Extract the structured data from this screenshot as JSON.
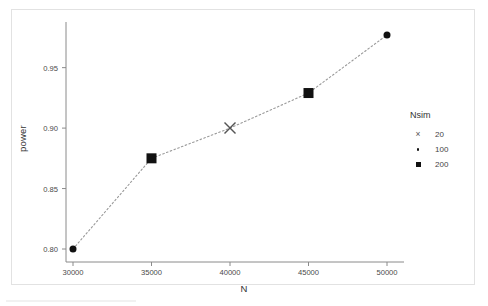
{
  "chart_data": {
    "type": "scatter",
    "title": "",
    "xlabel": "N",
    "ylabel": "power",
    "xlim": [
      28500,
      51500
    ],
    "ylim": [
      0.785,
      0.988
    ],
    "grid": false,
    "connector": "dotted-line",
    "x": [
      30000,
      35000,
      40000,
      45000,
      50000
    ],
    "values": [
      0.8,
      0.875,
      0.9,
      0.929,
      0.977
    ],
    "point_markers": [
      "circle",
      "square",
      "cross",
      "square",
      "circle"
    ],
    "point_groups": [
      100,
      200,
      20,
      200,
      100
    ],
    "xticks": [
      30000,
      35000,
      40000,
      45000,
      50000
    ],
    "xticklabels": [
      "30000",
      "35000",
      "40000",
      "45000",
      "50000"
    ],
    "yticks": [
      0.8,
      0.85,
      0.9,
      0.95
    ],
    "yticklabels": [
      "0.80",
      "0.85",
      "0.90",
      "0.95"
    ],
    "legend": {
      "title": "Nsim",
      "position": "right",
      "entries": [
        {
          "label": "20",
          "marker": "cross"
        },
        {
          "label": "100",
          "marker": "dot"
        },
        {
          "label": "200",
          "marker": "square"
        }
      ]
    },
    "colors": {
      "marker": "#111111",
      "cross": "#555555",
      "line": "#9a9a9a",
      "axis": "#8a8a8a",
      "panel_border": "#e2e2e2",
      "background": "#ffffff"
    }
  }
}
